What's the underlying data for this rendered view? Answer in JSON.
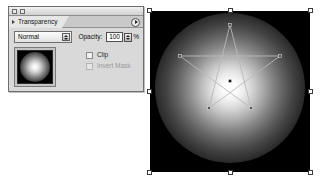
{
  "palette": {
    "window_widgets": [
      "collapse-widget",
      "zoom-widget"
    ],
    "tab": {
      "label": "Transparency",
      "arrow_icon": "triangle-right-icon"
    },
    "menu_button": {
      "icon": "panel-menu-icon"
    },
    "blend_mode": {
      "selected": "Normal",
      "options": [
        "Normal",
        "Multiply",
        "Screen",
        "Overlay",
        "Soft Light",
        "Hard Light",
        "Color Dodge",
        "Color Burn",
        "Darken",
        "Lighten",
        "Difference",
        "Exclusion",
        "Hue",
        "Saturation",
        "Color",
        "Luminosity"
      ]
    },
    "opacity": {
      "label": "Opacity:",
      "value": "100",
      "unit": "%"
    },
    "thumbnail": {
      "name": "opacity-mask-thumbnail",
      "description": "black square with white radial glow"
    },
    "checkboxes": [
      {
        "label": "Clip",
        "checked": false,
        "enabled": true
      },
      {
        "label": "Invert Mask",
        "checked": false,
        "enabled": false
      }
    ]
  },
  "artwork": {
    "name": "selected-star-artwork",
    "background_color": "#000000",
    "glow_color": "#ffffff",
    "path_color": "#b9b9b9",
    "handle_fill": "#ffffff",
    "handle_stroke": "#3a3a3a",
    "handle_count": 8,
    "star_points": 5,
    "center_anchor": true
  }
}
